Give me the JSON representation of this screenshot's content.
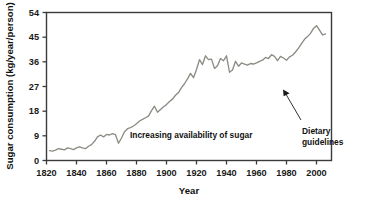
{
  "figure": {
    "background_color": "#ffffff",
    "line_color": "#8c8b84",
    "axis_color": "#3b3b3b",
    "text_color": "#111111"
  },
  "axes": {
    "ylabel": "Sugar consumption (kg/year/person)",
    "xlabel": "Year",
    "yticks": [
      "0",
      "9",
      "18",
      "27",
      "36",
      "45",
      "54"
    ],
    "xticks": [
      "1820",
      "1840",
      "1860",
      "1880",
      "1900",
      "1920",
      "1940",
      "1960",
      "1980",
      "2000"
    ]
  },
  "annotations": {
    "increasing": "Increasing availability of sugar",
    "dietary_line1": "Dietary",
    "dietary_line2": "guidelines"
  },
  "chart_data": {
    "type": "line",
    "title": "",
    "xlabel": "Year",
    "ylabel": "Sugar consumption (kg/year/person)",
    "xlim": [
      1820,
      2010
    ],
    "ylim": [
      0,
      54
    ],
    "xticks": [
      1820,
      1840,
      1860,
      1880,
      1900,
      1920,
      1940,
      1960,
      1980,
      2000
    ],
    "yticks": [
      0,
      9,
      18,
      27,
      36,
      45,
      54
    ],
    "grid": false,
    "legend": false,
    "annotations": [
      {
        "text": "Increasing availability of sugar",
        "x": 1895,
        "y": 14.0
      },
      {
        "text": "Dietary guidelines",
        "x": 1995,
        "y": 21.0,
        "points_to": {
          "x": 1978,
          "y": 36.5
        }
      }
    ],
    "series": [
      {
        "name": "Sugar consumption",
        "x": [
          1822,
          1824,
          1826,
          1828,
          1830,
          1832,
          1834,
          1836,
          1838,
          1840,
          1842,
          1844,
          1846,
          1848,
          1850,
          1852,
          1854,
          1856,
          1858,
          1860,
          1862,
          1864,
          1866,
          1868,
          1870,
          1872,
          1874,
          1876,
          1878,
          1880,
          1882,
          1884,
          1886,
          1888,
          1890,
          1892,
          1894,
          1896,
          1898,
          1900,
          1902,
          1904,
          1906,
          1908,
          1910,
          1912,
          1914,
          1916,
          1918,
          1920,
          1922,
          1924,
          1926,
          1928,
          1930,
          1932,
          1934,
          1936,
          1938,
          1940,
          1942,
          1944,
          1946,
          1948,
          1950,
          1952,
          1954,
          1956,
          1958,
          1960,
          1962,
          1964,
          1966,
          1968,
          1970,
          1972,
          1974,
          1976,
          1978,
          1980,
          1982,
          1984,
          1986,
          1988,
          1990,
          1992,
          1994,
          1996,
          1998,
          2000,
          2002,
          2004,
          2006
        ],
        "y": [
          3.6,
          3.4,
          3.8,
          4.3,
          4.1,
          3.9,
          4.6,
          4.3,
          4.0,
          4.6,
          5.0,
          4.6,
          4.3,
          5.2,
          5.8,
          7.0,
          8.6,
          9.3,
          8.6,
          9.5,
          9.3,
          9.8,
          9.4,
          6.3,
          8.2,
          10.5,
          11.6,
          12.0,
          12.6,
          13.4,
          14.4,
          15.0,
          15.6,
          16.2,
          18.2,
          19.8,
          17.6,
          18.6,
          19.6,
          20.4,
          21.5,
          22.4,
          23.8,
          24.8,
          26.6,
          28.0,
          29.8,
          31.8,
          30.2,
          33.2,
          36.8,
          35.0,
          38.2,
          36.8,
          37.0,
          33.6,
          34.6,
          37.2,
          36.4,
          38.2,
          32.2,
          33.0,
          36.2,
          34.4,
          35.6,
          35.2,
          34.8,
          35.4,
          35.2,
          35.6,
          36.2,
          36.6,
          37.6,
          37.2,
          38.6,
          38.0,
          36.4,
          38.0,
          37.4,
          36.6,
          37.8,
          38.4,
          39.6,
          41.0,
          42.6,
          44.2,
          45.2,
          46.4,
          48.2,
          49.2,
          47.6,
          45.8,
          46.2
        ]
      }
    ]
  }
}
